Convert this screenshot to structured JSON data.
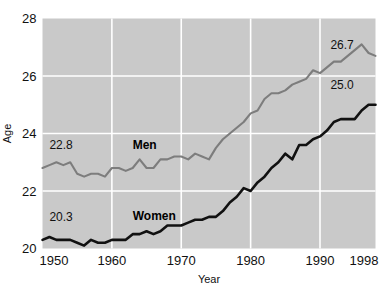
{
  "chart_data": {
    "type": "line",
    "title": "",
    "xlabel": "Year",
    "ylabel": "Age",
    "xlim": [
      1950,
      1998
    ],
    "ylim": [
      20,
      28
    ],
    "xticks": [
      1950,
      1960,
      1970,
      1980,
      1990,
      1998
    ],
    "xtick_labels": [
      "1950",
      "1960",
      "1970",
      "1980",
      "1990",
      "1998"
    ],
    "yticks": [
      20,
      22,
      24,
      26,
      28
    ],
    "ytick_labels": [
      "20",
      "22",
      "24",
      "26",
      "28"
    ],
    "grid": true,
    "legend_position": "inline-annotation",
    "plot_background": "#c9c9c9",
    "gridline_color": "#ffffff",
    "annotations": [
      {
        "name": "men-start-value",
        "text": "22.8",
        "x": 1951.0,
        "y": 23.45
      },
      {
        "name": "men-end-value",
        "text": "26.7",
        "x": 1991.5,
        "y": 26.95
      },
      {
        "name": "women-start-value",
        "text": "20.3",
        "x": 1951.0,
        "y": 20.95
      },
      {
        "name": "women-end-value",
        "text": "25.0",
        "x": 1991.5,
        "y": 25.55
      },
      {
        "name": "men-series-label",
        "text": "Men",
        "x": 1963.0,
        "y": 23.45
      },
      {
        "name": "women-series-label",
        "text": "Women",
        "x": 1963.0,
        "y": 21.0
      }
    ],
    "series": [
      {
        "name": "Men",
        "color": "#7d7d7d",
        "line_width": 2.1,
        "x": [
          1950,
          1951,
          1952,
          1953,
          1954,
          1955,
          1956,
          1957,
          1958,
          1959,
          1960,
          1961,
          1962,
          1963,
          1964,
          1965,
          1966,
          1967,
          1968,
          1969,
          1970,
          1971,
          1972,
          1973,
          1974,
          1975,
          1976,
          1977,
          1978,
          1979,
          1980,
          1981,
          1982,
          1983,
          1984,
          1985,
          1986,
          1987,
          1988,
          1989,
          1990,
          1991,
          1992,
          1993,
          1994,
          1995,
          1996,
          1997,
          1998
        ],
        "values": [
          22.8,
          22.9,
          23.0,
          22.9,
          23.0,
          22.6,
          22.5,
          22.6,
          22.6,
          22.5,
          22.8,
          22.8,
          22.7,
          22.8,
          23.1,
          22.8,
          22.8,
          23.1,
          23.1,
          23.2,
          23.2,
          23.1,
          23.3,
          23.2,
          23.1,
          23.5,
          23.8,
          24.0,
          24.2,
          24.4,
          24.7,
          24.8,
          25.2,
          25.4,
          25.4,
          25.5,
          25.7,
          25.8,
          25.9,
          26.2,
          26.1,
          26.3,
          26.5,
          26.5,
          26.7,
          26.9,
          27.1,
          26.8,
          26.7
        ]
      },
      {
        "name": "Women",
        "color": "#111111",
        "line_width": 2.6,
        "x": [
          1950,
          1951,
          1952,
          1953,
          1954,
          1955,
          1956,
          1957,
          1958,
          1959,
          1960,
          1961,
          1962,
          1963,
          1964,
          1965,
          1966,
          1967,
          1968,
          1969,
          1970,
          1971,
          1972,
          1973,
          1974,
          1975,
          1976,
          1977,
          1978,
          1979,
          1980,
          1981,
          1982,
          1983,
          1984,
          1985,
          1986,
          1987,
          1988,
          1989,
          1990,
          1991,
          1992,
          1993,
          1994,
          1995,
          1996,
          1997,
          1998
        ],
        "values": [
          20.3,
          20.4,
          20.3,
          20.3,
          20.3,
          20.2,
          20.1,
          20.3,
          20.2,
          20.2,
          20.3,
          20.3,
          20.3,
          20.5,
          20.5,
          20.6,
          20.5,
          20.6,
          20.8,
          20.8,
          20.8,
          20.9,
          21.0,
          21.0,
          21.1,
          21.1,
          21.3,
          21.6,
          21.8,
          22.1,
          22.0,
          22.3,
          22.5,
          22.8,
          23.0,
          23.3,
          23.1,
          23.6,
          23.6,
          23.8,
          23.9,
          24.1,
          24.4,
          24.5,
          24.5,
          24.5,
          24.8,
          25.0,
          25.0
        ]
      }
    ]
  }
}
